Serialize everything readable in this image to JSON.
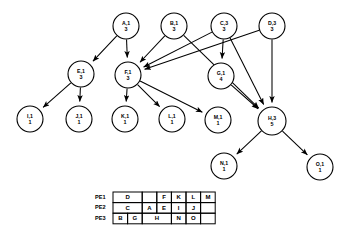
{
  "figure": {
    "title": ""
  },
  "graph": {
    "type": "directed-acyclic-graph",
    "node_label_format": "name,level over weight",
    "nodes": [
      {
        "id": "A",
        "label": "A,1",
        "weight": "3",
        "cx": 126,
        "cy": 26,
        "r": 13
      },
      {
        "id": "B",
        "label": "B,1",
        "weight": "3",
        "cx": 174,
        "cy": 26,
        "r": 13
      },
      {
        "id": "C",
        "label": "C,3",
        "weight": "3",
        "cx": 224,
        "cy": 26,
        "r": 13
      },
      {
        "id": "D",
        "label": "D,3",
        "weight": "3",
        "cx": 272,
        "cy": 26,
        "r": 13
      },
      {
        "id": "E",
        "label": "E,1",
        "weight": "3",
        "cx": 81,
        "cy": 74,
        "r": 13
      },
      {
        "id": "F",
        "label": "F,1",
        "weight": "3",
        "cx": 128,
        "cy": 75,
        "r": 13
      },
      {
        "id": "G",
        "label": "G,1",
        "weight": "4",
        "cx": 221,
        "cy": 76,
        "r": 13
      },
      {
        "id": "H",
        "label": "H,3",
        "weight": "5",
        "cx": 272,
        "cy": 121,
        "r": 14
      },
      {
        "id": "I",
        "label": "I,1",
        "weight": "1",
        "cx": 30,
        "cy": 119,
        "r": 13
      },
      {
        "id": "J",
        "label": "J,1",
        "weight": "1",
        "cx": 79,
        "cy": 119,
        "r": 13
      },
      {
        "id": "K",
        "label": "K,1",
        "weight": "1",
        "cx": 125,
        "cy": 119,
        "r": 13
      },
      {
        "id": "L",
        "label": "L,1",
        "weight": "1",
        "cx": 172,
        "cy": 119,
        "r": 13
      },
      {
        "id": "M",
        "label": "M,1",
        "weight": "1",
        "cx": 218,
        "cy": 120,
        "r": 13
      },
      {
        "id": "N",
        "label": "N,1",
        "weight": "1",
        "cx": 224,
        "cy": 166,
        "r": 13
      },
      {
        "id": "O",
        "label": "O,1",
        "weight": "1",
        "cx": 320,
        "cy": 167,
        "r": 13
      }
    ],
    "edges": [
      {
        "from": "A",
        "to": "E"
      },
      {
        "from": "A",
        "to": "F"
      },
      {
        "from": "B",
        "to": "F"
      },
      {
        "from": "C",
        "to": "F"
      },
      {
        "from": "C",
        "to": "G"
      },
      {
        "from": "C",
        "to": "H"
      },
      {
        "from": "D",
        "to": "F"
      },
      {
        "from": "D",
        "to": "H"
      },
      {
        "from": "B",
        "to": "H"
      },
      {
        "from": "E",
        "to": "I"
      },
      {
        "from": "E",
        "to": "J"
      },
      {
        "from": "F",
        "to": "K"
      },
      {
        "from": "F",
        "to": "L"
      },
      {
        "from": "F",
        "to": "M"
      },
      {
        "from": "G",
        "to": "H"
      },
      {
        "from": "H",
        "to": "N"
      },
      {
        "from": "H",
        "to": "O"
      }
    ]
  },
  "schedule_table": {
    "row_labels": [
      "PE1",
      "PE2",
      "PE3"
    ],
    "rows": [
      {
        "label": "PE1",
        "cells": [
          {
            "text": "D",
            "span": 2
          },
          {
            "text": "",
            "span": 1
          },
          {
            "text": "F",
            "span": 1
          },
          {
            "text": "K",
            "span": 1
          },
          {
            "text": "L",
            "span": 1
          },
          {
            "text": "M",
            "span": 1
          }
        ]
      },
      {
        "label": "PE2",
        "cells": [
          {
            "text": "C",
            "span": 2
          },
          {
            "text": "A",
            "span": 1
          },
          {
            "text": "E",
            "span": 1
          },
          {
            "text": "I",
            "span": 1
          },
          {
            "text": "J",
            "span": 1
          },
          {
            "text": "",
            "span": 1
          }
        ]
      },
      {
        "label": "PE3",
        "cells": [
          {
            "text": "B",
            "span": 1
          },
          {
            "text": "G",
            "span": 1
          },
          {
            "text": "H",
            "span": 2
          },
          {
            "text": "N",
            "span": 1
          },
          {
            "text": "O",
            "span": 1
          },
          {
            "text": "",
            "span": 1
          }
        ]
      }
    ],
    "geometry": {
      "x": 113,
      "y": 192,
      "col_width": 14.6,
      "row_height": 10.6,
      "cols": 7,
      "rows": 3
    }
  },
  "colors": {
    "stroke": "#000000",
    "fill": "#ffffff",
    "text": "#000000"
  }
}
